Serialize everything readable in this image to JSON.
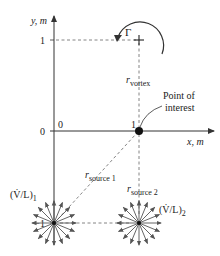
{
  "axes": {
    "y_label": "y, m",
    "x_label": "x, m",
    "y_tick_1": "1",
    "y_tick_0": "0",
    "y_tick_neg1": "−1",
    "origin_label": "0",
    "x_tick_1": "1"
  },
  "vortex": {
    "circulation_symbol": "Γ",
    "radius_label_main": "r",
    "radius_label_sub": "vortex",
    "position": [
      1,
      1
    ]
  },
  "point_of_interest": {
    "label_line1": "Point of",
    "label_line2": "interest",
    "position": [
      1,
      0
    ]
  },
  "source1": {
    "strength_label": "(V̇/L)",
    "strength_sub": "1",
    "radius_label_main": "r",
    "radius_label_sub": "source 1",
    "position": [
      0,
      -1
    ]
  },
  "source2": {
    "strength_label": "(V̇/L)",
    "strength_sub": "2",
    "radius_label_main": "r",
    "radius_label_sub": "source 2",
    "position": [
      1,
      -1
    ]
  },
  "colors": {
    "axis": "#333333",
    "dash": "#666666",
    "arrow": "#555555",
    "dot": "#111111"
  }
}
